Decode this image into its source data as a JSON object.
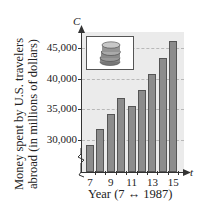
{
  "chart_data": {
    "type": "bar",
    "title": "",
    "xlabel": "Year (7 ↔ 1987)",
    "ylabel": "Money spent by U.S. travelers abroad (in millions of dollars)",
    "x_axis_variable": "t",
    "y_axis_variable": "C",
    "categories": [
      "7",
      "8",
      "9",
      "10",
      "11",
      "12",
      "13",
      "14",
      "15"
    ],
    "values": [
      29200,
      31800,
      34300,
      36900,
      35600,
      38200,
      40800,
      43400,
      46100
    ],
    "x_tick_labels": [
      "7",
      "9",
      "11",
      "13",
      "15"
    ],
    "y_tick_labels": [
      "30,000",
      "35,000",
      "40,000",
      "45,000"
    ],
    "ylim": [
      25000,
      47500
    ],
    "y_axis_break": true,
    "grid": true,
    "legend": null,
    "image_inset": "coin-stack"
  },
  "labels": {
    "c": "C",
    "t": "t",
    "ytitle_line1": "Money spent by U.S. travelers",
    "ytitle_line2": "abroad (in millions of dollars)",
    "xtitle": "Year (7 ↔ 1987)"
  }
}
